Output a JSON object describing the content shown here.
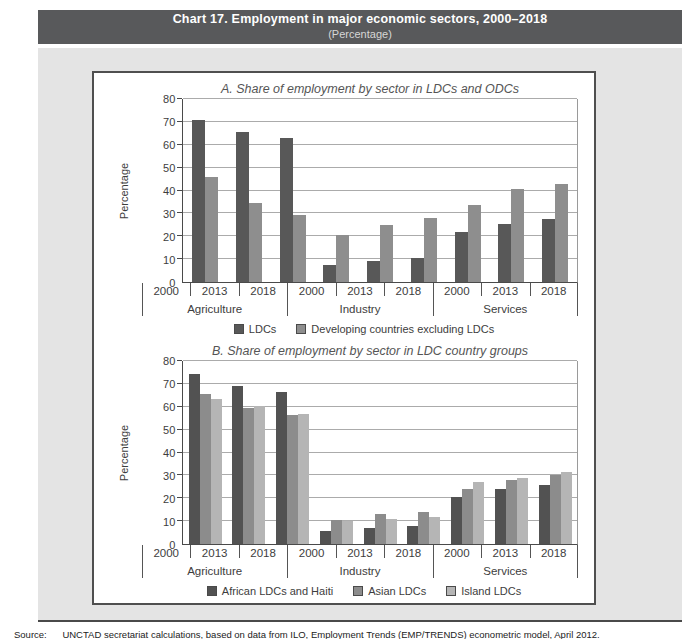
{
  "header": {
    "title": "Chart 17. Employment in major economic sectors, 2000–2018",
    "subtitle": "(Percentage)"
  },
  "source_note": {
    "label": "Source:",
    "text": "UNCTAD secretariat calculations, based on data from ILO, Employment Trends (EMP/TRENDS) econometric model, April 2012."
  },
  "colors": {
    "header_bar": "#58595b",
    "panel_background": "#e4e4e4",
    "chart_border": "#4f4f4f",
    "gridline": "#ababab"
  },
  "chart_data": [
    {
      "type": "bar",
      "title": "A. Share of employment by sector in LDCs and ODCs",
      "ylabel": "Percentage",
      "ylim": [
        0,
        80
      ],
      "ytick_step": 10,
      "grid": true,
      "legend_position": "bottom",
      "sectors": [
        "Agriculture",
        "Industry",
        "Services"
      ],
      "years": [
        "2000",
        "2013",
        "2018"
      ],
      "categories": [
        "Agriculture 2000",
        "Agriculture 2013",
        "Agriculture 2018",
        "Industry 2000",
        "Industry 2013",
        "Industry 2018",
        "Services 2000",
        "Services 2013",
        "Services 2018"
      ],
      "series": [
        {
          "name": "LDCs",
          "color": "#585858",
          "values": [
            71,
            65.5,
            63,
            7.5,
            9,
            10.5,
            22,
            25.5,
            27.5
          ]
        },
        {
          "name": "Developing countries excluding LDCs",
          "color": "#8e8e8e",
          "values": [
            46,
            34.5,
            29.5,
            20.5,
            25,
            28,
            33.5,
            40.5,
            43
          ]
        }
      ]
    },
    {
      "type": "bar",
      "title": "B. Share of employment by sector in LDC country groups",
      "ylabel": "Percentage",
      "ylim": [
        0,
        80
      ],
      "ytick_step": 10,
      "grid": true,
      "legend_position": "bottom",
      "sectors": [
        "Agriculture",
        "Industry",
        "Services"
      ],
      "years": [
        "2000",
        "2013",
        "2018"
      ],
      "categories": [
        "Agriculture 2000",
        "Agriculture 2013",
        "Agriculture 2018",
        "Industry 2000",
        "Industry 2013",
        "Industry 2018",
        "Services 2000",
        "Services 2013",
        "Services 2018"
      ],
      "series": [
        {
          "name": "African LDCs and Haiti",
          "color": "#525252",
          "values": [
            74.5,
            69,
            66.5,
            5.5,
            7,
            8,
            20.5,
            24,
            26
          ]
        },
        {
          "name": "Asian LDCs",
          "color": "#8c8c8c",
          "values": [
            65.5,
            59.5,
            56.5,
            10.5,
            13,
            14,
            24,
            28,
            30
          ]
        },
        {
          "name": "Island LDCs",
          "color": "#b5b5b5",
          "values": [
            63.5,
            60.5,
            57,
            10,
            11,
            12,
            27,
            29,
            31.5
          ]
        }
      ]
    }
  ]
}
